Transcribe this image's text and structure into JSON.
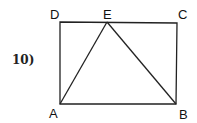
{
  "problem_number": "10)",
  "points": {
    "A": {
      "label": "A",
      "x": 60,
      "y": 104
    },
    "B": {
      "label": "B",
      "x": 176,
      "y": 104
    },
    "C": {
      "label": "C",
      "x": 177,
      "y": 23
    },
    "D": {
      "label": "D",
      "x": 60,
      "y": 22
    },
    "E": {
      "label": "E",
      "x": 107,
      "y": 22
    }
  },
  "segments": [
    "AB",
    "BC",
    "CD",
    "DA",
    "AE",
    "EB"
  ]
}
